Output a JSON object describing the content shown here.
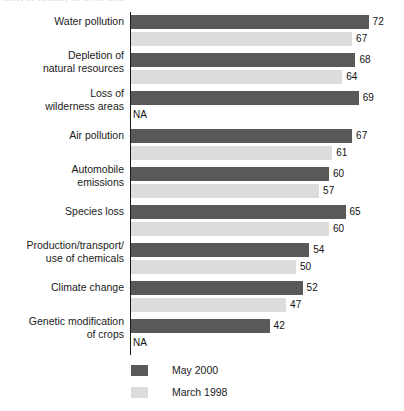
{
  "header": {
    "clipped_text": "……, … ………, … … … ……"
  },
  "chart_data": {
    "type": "bar",
    "orientation": "horizontal",
    "title": "",
    "xlabel": "",
    "ylabel": "",
    "xlim": [
      0,
      72
    ],
    "grid": false,
    "legend_position": "bottom-left",
    "na_text": "NA",
    "categories": [
      "Water pollution",
      "Depletion of\nnatural resources",
      "Loss of\nwilderness areas",
      "Air pollution",
      "Automobile\nemissions",
      "Species loss",
      "Production/transport/\nuse of chemicals",
      "Climate change",
      "Genetic modification\nof crops"
    ],
    "series": [
      {
        "name": "May 2000",
        "color": "#595959",
        "values": [
          72,
          68,
          69,
          67,
          60,
          65,
          54,
          52,
          42
        ],
        "labels": [
          "72",
          "68",
          "69",
          "67",
          "60",
          "65",
          "54",
          "52",
          "42"
        ]
      },
      {
        "name": "March 1998",
        "color": "#dcdcdc",
        "values": [
          67,
          64,
          null,
          61,
          57,
          60,
          50,
          47,
          null
        ],
        "labels": [
          "67",
          "64",
          "NA",
          "61",
          "57",
          "60",
          "50",
          "47",
          "NA"
        ]
      }
    ]
  }
}
